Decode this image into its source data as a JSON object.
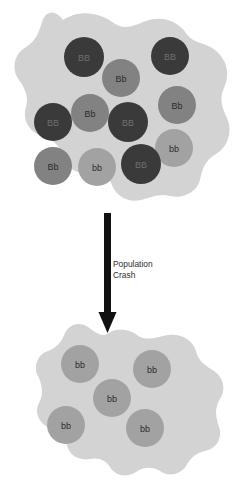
{
  "diagram": {
    "title_fragment": "",
    "colors": {
      "page_background": "#ffffff",
      "population_blob": "#d3d3d3",
      "homozygous_dominant": "#3a3a3a",
      "heterozygous": "#828282",
      "homozygous_recessive": "#a2a2a2",
      "arrow": "#111111",
      "dark_circle_text": "#6f6f6f",
      "medium_circle_text": "#2b2b2b",
      "light_circle_text": "#2b2b2b",
      "label_text": "#2e2e2e"
    },
    "arrow": {
      "name": "population-crash-arrow",
      "direction": "down",
      "label_lines": [
        "Population",
        "Crash"
      ],
      "label_x": 113,
      "label_y": 259,
      "shaft_x": 104,
      "shaft_top": 213,
      "shaft_bottom": 312,
      "shaft_width": 7,
      "head_tip_y": 333,
      "head_half_width": 9
    },
    "before": {
      "name": "population-before-crash",
      "blob_path": "M 63 20 C 80 9 100 13 112 22 C 124 31 133 26 146 21 C 162 15 178 21 186 33 C 193 44 205 42 215 50 C 228 60 230 76 224 88 C 219 98 222 108 227 118 C 233 131 228 147 216 154 C 205 160 202 170 200 180 C 197 192 183 199 170 196 C 158 193 150 198 141 200 C 128 203 116 196 112 185 C 109 176 100 172 90 173 C 77 175 65 167 62 155 C 60 145 52 139 42 136 C 29 132 22 119 26 107 C 29 97 25 88 19 80 C 11 69 14 54 26 47 C 36 41 39 32 42 22 C 45 12 54 8 63 20 Z",
      "total_count": 11,
      "circles": [
        {
          "genotype": "BB",
          "type": "homozygous_dominant",
          "cx": 84,
          "cy": 57,
          "r": 20
        },
        {
          "genotype": "BB",
          "type": "homozygous_dominant",
          "cx": 170,
          "cy": 56,
          "r": 19
        },
        {
          "genotype": "Bb",
          "type": "heterozygous",
          "cx": 121,
          "cy": 78,
          "r": 19
        },
        {
          "genotype": "Bb",
          "type": "heterozygous",
          "cx": 90,
          "cy": 113,
          "r": 19
        },
        {
          "genotype": "Bb",
          "type": "heterozygous",
          "cx": 177,
          "cy": 105,
          "r": 19
        },
        {
          "genotype": "BB",
          "type": "homozygous_dominant",
          "cx": 53,
          "cy": 122,
          "r": 19
        },
        {
          "genotype": "BB",
          "type": "homozygous_dominant",
          "cx": 128,
          "cy": 122,
          "r": 20
        },
        {
          "genotype": "bb",
          "type": "homozygous_recessive",
          "cx": 174,
          "cy": 148,
          "r": 19
        },
        {
          "genotype": "Bb",
          "type": "heterozygous",
          "cx": 53,
          "cy": 166,
          "r": 19
        },
        {
          "genotype": "bb",
          "type": "homozygous_recessive",
          "cx": 97,
          "cy": 167,
          "r": 19
        },
        {
          "genotype": "BB",
          "type": "homozygous_dominant",
          "cx": 141,
          "cy": 164,
          "r": 20
        }
      ]
    },
    "after": {
      "name": "population-after-crash",
      "blob_path": "M 107 334 C 117 327 129 329 137 335 C 146 342 157 337 168 335 C 181 333 193 340 196 351 C 198 361 206 366 214 371 C 224 378 226 390 220 399 C 214 408 216 418 219 427 C 223 438 216 449 205 451 C 195 453 190 459 186 466 C 180 475 168 477 160 471 C 152 466 143 467 136 472 C 127 478 115 476 110 467 C 106 460 98 457 90 459 C 79 461 69 455 67 445 C 65 436 58 431 50 428 C 39 424 34 412 39 403 C 44 394 42 384 38 376 C 33 366 38 354 48 351 C 57 348 62 341 65 333 C 69 324 80 321 88 327 C 95 332 101 337 107 334 Z",
      "total_count": 5,
      "circles": [
        {
          "genotype": "bb",
          "type": "homozygous_recessive",
          "cx": 80,
          "cy": 364,
          "r": 19
        },
        {
          "genotype": "bb",
          "type": "homozygous_recessive",
          "cx": 152,
          "cy": 369,
          "r": 19
        },
        {
          "genotype": "bb",
          "type": "homozygous_recessive",
          "cx": 112,
          "cy": 398,
          "r": 19
        },
        {
          "genotype": "bb",
          "type": "homozygous_recessive",
          "cx": 66,
          "cy": 425,
          "r": 19
        },
        {
          "genotype": "bb",
          "type": "homozygous_recessive",
          "cx": 145,
          "cy": 428,
          "r": 19
        }
      ]
    }
  }
}
